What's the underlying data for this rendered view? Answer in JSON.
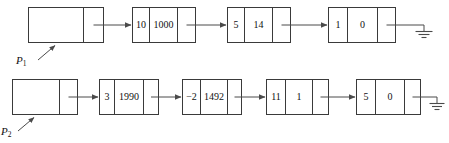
{
  "figure": {
    "background_color": "#ffffff",
    "stroke_color": "#3a3a3a",
    "link_color": "#4a4a4a",
    "text_color": "#111111"
  },
  "lists": [
    {
      "id": "list-1",
      "pointer_label": "P",
      "pointer_subscript": "1",
      "header": {
        "name": "header-box",
        "left_cell_value": "",
        "right_cell_value": ""
      },
      "nodes": [
        {
          "coefficient": "10",
          "exponent": "1000",
          "pointer_cell": ""
        },
        {
          "coefficient": "5",
          "exponent": "14",
          "pointer_cell": ""
        },
        {
          "coefficient": "1",
          "exponent": "0",
          "pointer_cell": ""
        }
      ],
      "terminator": "ground-symbol"
    },
    {
      "id": "list-2",
      "pointer_label": "P",
      "pointer_subscript": "2",
      "header": {
        "name": "header-box",
        "left_cell_value": "",
        "right_cell_value": ""
      },
      "nodes": [
        {
          "coefficient": "3",
          "exponent": "1990",
          "pointer_cell": ""
        },
        {
          "coefficient": "−2",
          "exponent": "1492",
          "pointer_cell": ""
        },
        {
          "coefficient": "11",
          "exponent": "1",
          "pointer_cell": ""
        },
        {
          "coefficient": "5",
          "exponent": "0",
          "pointer_cell": ""
        }
      ],
      "terminator": "ground-symbol"
    }
  ],
  "caption": {
    "text": ""
  }
}
